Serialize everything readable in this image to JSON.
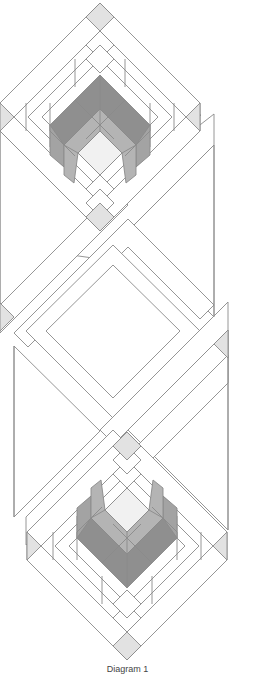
{
  "diagram": {
    "caption": "Diagram 1",
    "colors": {
      "line": "#8a8a8a",
      "background": "#ffffff",
      "cornerstone": "#e2e2e2",
      "center_light": "#f1f1f1",
      "mid_gray": "#b4b4b4",
      "dark_gray": "#8f8f8f",
      "side_gray": "#a3a3a3"
    },
    "blocks": [
      {
        "name": "top-block",
        "orientation": "chevron-up"
      },
      {
        "name": "bottom-block",
        "orientation": "chevron-down"
      }
    ],
    "sashing": {
      "description": "diagonal lattice strips crossing between blocks with gray cornerstones"
    }
  }
}
